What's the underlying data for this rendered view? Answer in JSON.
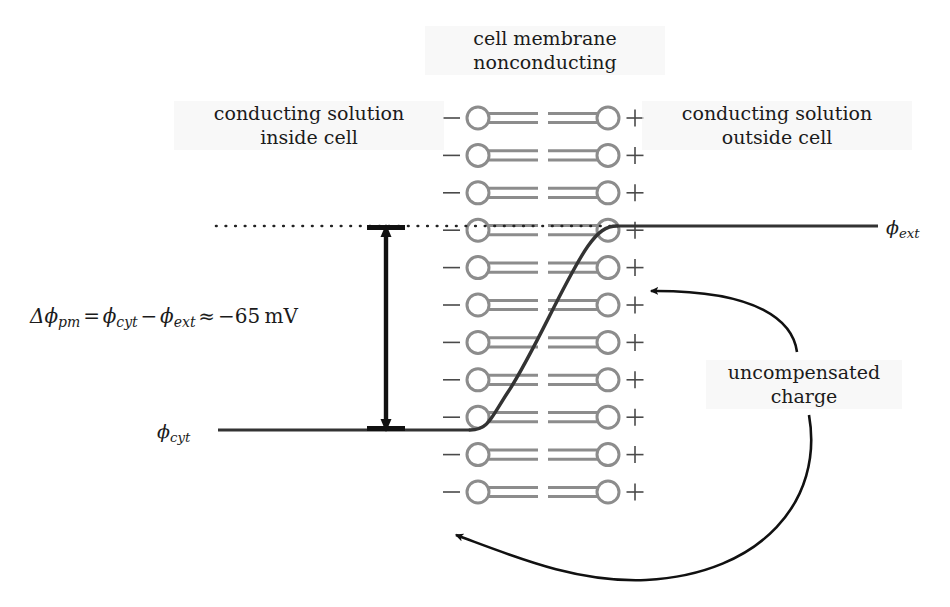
{
  "figure": {
    "type": "schematic-diagram"
  },
  "labels": {
    "membrane_title": "cell membrane\nnonconducting",
    "inside": "conducting solution\ninside cell",
    "outside": "conducting solution\noutside cell",
    "uncompensated": "uncompensated\ncharge"
  },
  "equation": {
    "delta": "Δ",
    "phi": "ϕ",
    "sub_pm": "pm",
    "equals": "=",
    "sub_cyt": "cyt",
    "minus": "−",
    "sub_ext": "ext",
    "approx": "≈",
    "value": "−65",
    "unit": "mV",
    "full_text": "Δϕpm = ϕcyt − ϕext ≈ −65 mV"
  },
  "potential_labels": {
    "ext": {
      "phi": "ϕ",
      "sub": "ext"
    },
    "cyt": {
      "phi": "ϕ",
      "sub": "cyt"
    }
  },
  "charges": {
    "inner_symbol": "−",
    "outer_symbol": "+",
    "rows": 11
  },
  "chart_data": {
    "type": "line",
    "xlabel": "",
    "ylabel": "electric potential",
    "series": [
      {
        "name": "phi_cyt (cytoplasmic plateau)",
        "x": [
          218,
          470
        ],
        "y": [
          430,
          430
        ]
      },
      {
        "name": "transmembrane ramp",
        "x": [
          470,
          520,
          570,
          617
        ],
        "y": [
          430,
          382,
          272,
          226
        ]
      },
      {
        "name": "phi_ext (extracellular plateau)",
        "x": [
          617,
          878
        ],
        "y": [
          226,
          226
        ]
      }
    ],
    "annotations": [
      {
        "text": "Δϕpm ≈ −65 mV",
        "type": "double-arrow",
        "x": 386,
        "y0": 226,
        "y1": 430
      },
      {
        "text": "ϕext reference level",
        "type": "dotted-line",
        "y": 226,
        "x0": 216,
        "x1": 617
      }
    ],
    "legend": "none",
    "grid": false
  },
  "colors": {
    "lipid_gray": "#8c8c8c",
    "line_dark": "#2a2a2a",
    "text": "#1b1b1b",
    "label_bg": "#f3f3f3"
  },
  "geometry": {
    "membrane_left_x": 478,
    "membrane_right_x": 608,
    "row_top_y": 118,
    "row_spacing": 37.4,
    "head_radius": 11
  }
}
